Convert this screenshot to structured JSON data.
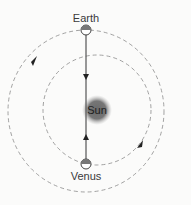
{
  "diagram": {
    "labels": {
      "earth": "Earth",
      "venus": "Venus",
      "sun": "Sun"
    },
    "icons": {
      "earth": "planet-half-shaded-icon",
      "venus": "planet-half-shaded-icon",
      "sun": "sun-glow-icon",
      "arrow": "direction-arrowhead-icon"
    },
    "colors": {
      "background": "#fbfbfa",
      "orbit": "#8a8a8a",
      "line": "#555555",
      "sun": "#6e6e6e",
      "text": "#3a3a3a"
    },
    "orbits": [
      "Earth orbit",
      "Venus orbit"
    ],
    "direction": "counter-clockwise"
  }
}
